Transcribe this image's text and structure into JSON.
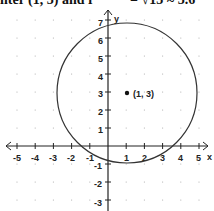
{
  "caption": {
    "left": "nter (1, 3) and r",
    "right": "= √13 ≈ 3.6"
  },
  "chart_data": {
    "type": "scatter",
    "title": "",
    "xlabel": "x",
    "ylabel": "y",
    "xlim": [
      -5,
      5
    ],
    "ylim": [
      -3,
      7
    ],
    "grid": "dots",
    "x_ticks": [
      -5,
      -4,
      -3,
      -2,
      -1,
      1,
      2,
      3,
      4,
      5
    ],
    "y_ticks": [
      -3,
      -2,
      -1,
      1,
      2,
      3,
      4,
      5,
      6,
      7
    ],
    "shapes": [
      {
        "kind": "circle",
        "center": [
          1,
          3
        ],
        "radius": 3.6
      }
    ],
    "points": [
      {
        "x": 1,
        "y": 3,
        "label": "(1, 3)"
      }
    ]
  },
  "labels": {
    "x_axis": "x",
    "y_axis": "y",
    "center_point": "(1, 3)",
    "xt": [
      "-5",
      "-4",
      "-3",
      "-2",
      "-1",
      "1",
      "2",
      "3",
      "4",
      "5"
    ],
    "yt": [
      "7",
      "6",
      "5",
      "4",
      "3",
      "2",
      "1",
      "-1",
      "-2",
      "-3"
    ]
  }
}
